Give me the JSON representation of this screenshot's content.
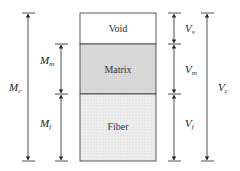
{
  "diagram": {
    "regions": [
      {
        "name": "Void",
        "fill": "#ffffff"
      },
      {
        "name": "Matrix",
        "fill": "#d9d9d9"
      },
      {
        "name": "Fiber",
        "fill": "#ececec"
      }
    ],
    "mass_labels": {
      "composite": {
        "base": "M",
        "sub": "c"
      },
      "matrix": {
        "base": "M",
        "sub": "m"
      },
      "fiber": {
        "base": "M",
        "sub": "f"
      }
    },
    "volume_labels": {
      "void": {
        "base": "V",
        "sub": "v"
      },
      "matrix": {
        "base": "V",
        "sub": "m"
      },
      "fiber": {
        "base": "V",
        "sub": "f"
      },
      "composite": {
        "base": "V",
        "sub": "c"
      }
    }
  }
}
